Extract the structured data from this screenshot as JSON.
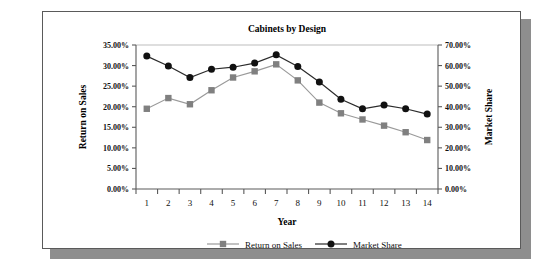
{
  "chart_data": {
    "type": "line",
    "title": "Cabinets by Design",
    "xlabel": "Year",
    "ylabel": "Return on Sales",
    "y2label": "Market Share",
    "grid": false,
    "legend_position": "bottom",
    "categories": [
      "1",
      "2",
      "3",
      "4",
      "5",
      "6",
      "7",
      "8",
      "9",
      "10",
      "11",
      "12",
      "13",
      "14"
    ],
    "x": [
      1,
      2,
      3,
      4,
      5,
      6,
      7,
      8,
      9,
      10,
      11,
      12,
      13,
      14
    ],
    "ylim": [
      0,
      35
    ],
    "y2lim": [
      0,
      70
    ],
    "yticks": [
      "0.00%",
      "5.00%",
      "10.00%",
      "15.00%",
      "20.00%",
      "25.00%",
      "30.00%",
      "35.00%"
    ],
    "ytick_values": [
      0,
      5,
      10,
      15,
      20,
      25,
      30,
      35
    ],
    "y2ticks": [
      "0.00%",
      "10.00%",
      "20.00%",
      "30.00%",
      "40.00%",
      "50.00%",
      "60.00%",
      "70.00%"
    ],
    "y2tick_values": [
      0,
      10,
      20,
      30,
      40,
      50,
      60,
      70
    ],
    "series": [
      {
        "name": "Return on Sales",
        "axis": "left",
        "marker": "square",
        "color": "#808080",
        "line_color": "#9a9a9a",
        "values": [
          19.5,
          22.1,
          20.6,
          24.0,
          27.1,
          28.6,
          30.3,
          26.4,
          21.0,
          18.4,
          16.9,
          15.4,
          13.8,
          11.9
        ]
      },
      {
        "name": "Market Share",
        "axis": "right",
        "marker": "circle",
        "color": "#111111",
        "line_color": "#2b2b2b",
        "values": [
          64.6,
          59.8,
          54.2,
          58.2,
          59.2,
          61.2,
          65.2,
          59.6,
          52.0,
          43.6,
          39.0,
          40.8,
          39.0,
          36.4
        ]
      }
    ]
  },
  "legend": {
    "items": [
      {
        "label": "Return on Sales"
      },
      {
        "label": "Market Share"
      }
    ]
  },
  "colors": {
    "return_on_sales": "#808080",
    "market_share": "#111111",
    "axis": "#5a5a5a",
    "frame": "#5a5a5a"
  }
}
